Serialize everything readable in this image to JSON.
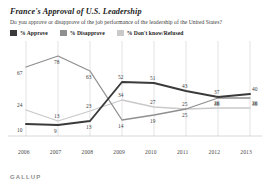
{
  "header": {
    "title": "France's Approval of U.S. Leadership",
    "subtitle": "Do you approve or disapprove of the job performance of the leadership of the United States?"
  },
  "legend": {
    "position": "top-left",
    "items": [
      {
        "label": "% Approve",
        "color": "#3a3a3a"
      },
      {
        "label": "% Disapprove",
        "color": "#8f8f8f"
      },
      {
        "label": "% Don't know/Refused",
        "color": "#c9c9c9"
      }
    ]
  },
  "footer": {
    "brand": "GALLUP"
  },
  "chart_data": {
    "type": "line",
    "title": "France's Approval of U.S. Leadership",
    "subtitle": "Do you approve or disapprove of the job performance of the leadership of the United States?",
    "xlabel": "",
    "ylabel": "",
    "ylim": [
      0,
      85
    ],
    "grid": "vertical",
    "legend_position": "top-left",
    "categories": [
      "2006",
      "2007",
      "2008",
      "2009",
      "2010",
      "2011",
      "2012",
      "2013"
    ],
    "series": [
      {
        "name": "% Approve",
        "color": "#3a3a3a",
        "values": [
          10,
          9,
          13,
          52,
          51,
          43,
          37,
          40
        ]
      },
      {
        "name": "% Disapprove",
        "color": "#8f8f8f",
        "values": [
          67,
          78,
          63,
          14,
          19,
          25,
          36,
          36
        ]
      },
      {
        "name": "% Don't know/Refused",
        "color": "#c9c9c9",
        "values": [
          24,
          13,
          23,
          34,
          27,
          25,
          26,
          26
        ]
      }
    ]
  }
}
